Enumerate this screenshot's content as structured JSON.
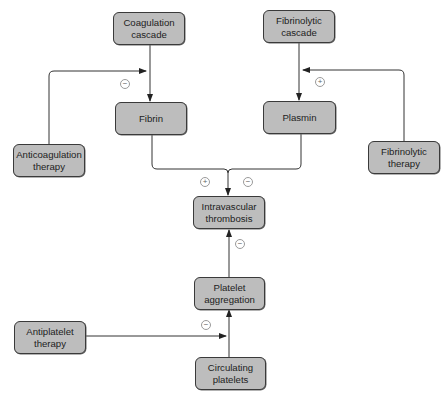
{
  "diagram": {
    "type": "flowchart",
    "title": "",
    "nodes": {
      "coagulation_cascade": "Coagulation\ncascade",
      "fibrinolytic_cascade": "Fibrinolytic\ncascade",
      "fibrin": "Fibrin",
      "plasmin": "Plasmin",
      "anticoagulation_therapy": "Anticoagulation\ntherapy",
      "fibrinolytic_therapy": "Fibrinolytic\ntherapy",
      "intravascular_thrombosis": "Intravascular\nthrombosis",
      "platelet_aggregation": "Platelet\naggregation",
      "antiplatelet_therapy": "Antiplatelet\ntherapy",
      "circulating_platelets": "Circulating\nplatelets"
    },
    "signs": {
      "anticoagulation_effect": "−",
      "fibrinolytic_therapy_effect": "+",
      "fibrin_to_thrombosis": "+",
      "plasmin_to_thrombosis": "−",
      "aggregation_to_thrombosis": "−",
      "antiplatelet_effect": "−"
    },
    "edges": [
      {
        "from": "Coagulation cascade",
        "to": "Fibrin"
      },
      {
        "from": "Fibrinolytic cascade",
        "to": "Plasmin"
      },
      {
        "from": "Anticoagulation therapy",
        "to": "Coagulation cascade → Fibrin",
        "effect": "−"
      },
      {
        "from": "Fibrinolytic therapy",
        "to": "Fibrinolytic cascade → Plasmin",
        "effect": "+"
      },
      {
        "from": "Fibrin",
        "to": "Intravascular thrombosis",
        "effect": "+"
      },
      {
        "from": "Plasmin",
        "to": "Intravascular thrombosis",
        "effect": "−"
      },
      {
        "from": "Platelet aggregation",
        "to": "Intravascular thrombosis",
        "effect": "−"
      },
      {
        "from": "Circulating platelets",
        "to": "Platelet aggregation"
      },
      {
        "from": "Antiplatelet therapy",
        "to": "Circulating platelets → Platelet aggregation",
        "effect": "−"
      }
    ],
    "colors": {
      "node_fill": "#bdbdbd",
      "node_border": "#3a3a3a",
      "edge": "#333333",
      "sign_circle": "#9a9a9a"
    }
  }
}
